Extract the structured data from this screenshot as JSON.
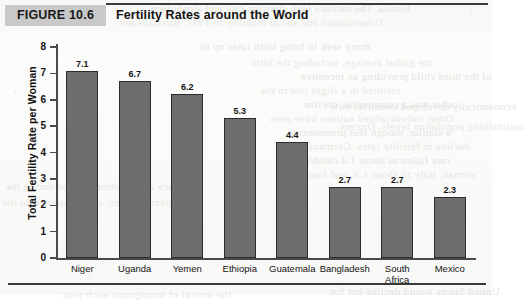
{
  "figure": {
    "badge": "FIGURE 10.6",
    "title": "Fertility Rates around the World"
  },
  "colors": {
    "bar_fill": "#6d6d6d",
    "bar_border": "#2c2c2c",
    "badge_bg": "#c9c9c9",
    "rule": "#3a3a3a",
    "text": "#141414"
  },
  "chart_data": {
    "type": "bar",
    "title": "Fertility Rates around the World",
    "xlabel": "",
    "ylabel": "Total Fertility Rate per Woman",
    "ylim": [
      0,
      8
    ],
    "yticks": [
      0,
      1,
      2,
      3,
      4,
      5,
      6,
      7,
      8
    ],
    "ytick_labels": [
      "0",
      "1",
      "2",
      "3",
      "4",
      "5",
      "6",
      "7",
      "8"
    ],
    "grid": false,
    "legend": null,
    "categories": [
      "Niger",
      "Uganda",
      "Yemen",
      "Ethiopia",
      "Guatemala",
      "Bangladesh",
      "South Africa",
      "Mexico"
    ],
    "category_lines": [
      [
        "Niger"
      ],
      [
        "Uganda"
      ],
      [
        "Yemen"
      ],
      [
        "Ethiopia"
      ],
      [
        "Guatemala"
      ],
      [
        "Bangladesh"
      ],
      [
        "South",
        "Africa"
      ],
      [
        "Mexico"
      ]
    ],
    "values": [
      7.1,
      6.7,
      6.2,
      5.3,
      4.4,
      2.7,
      2.7,
      2.3
    ],
    "value_labels": [
      "7.1",
      "6.7",
      "6.2",
      "5.3",
      "4.4",
      "2.7",
      "2.7",
      "2.3"
    ]
  },
  "bleed_text": [
    "Russia. The nation's high abortion rate and alcoholism",
    "Urbanization and social mobility in 1997. Russians are",
    "many seek to bring birth rates up to",
    "the global average, including the birth",
    "of the third child providing an incentive",
    "resulted in a slight rise in the",
    "what was a catastrophic decline.",
    "Other industrialized nations have seen",
    "a similar, though less pronounced",
    "decline in fertility rates. Germany's",
    "rate fallen to about 1.4 children per",
    "woman, Italy to about 1.4, and Japan",
    "economically developed countries now",
    "maintaining population levels. Dozens",
    "face a population decline during the",
    "next decades, and population in the",
    "United States would decline but for",
    "the arrival of immigrants each year."
  ]
}
